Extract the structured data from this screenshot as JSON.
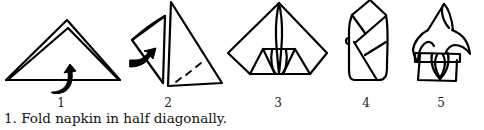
{
  "diagram": {
    "steps": [
      {
        "number": "1",
        "x": 61
      },
      {
        "number": "2",
        "x": 168
      },
      {
        "number": "3",
        "x": 278
      },
      {
        "number": "4",
        "x": 366
      },
      {
        "number": "5",
        "x": 441
      }
    ]
  },
  "caption": "1. Fold napkin in half diagonally."
}
